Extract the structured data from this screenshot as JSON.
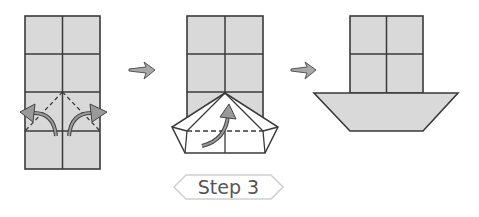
{
  "diagram": {
    "type": "origami-instructions",
    "step_label": "Step 3",
    "colors": {
      "paper_fill": "#d9d9d9",
      "outline": "#3a3a3a",
      "arrow_fill": "#9a9a9a",
      "arrow_stroke": "#444444",
      "badge_stroke": "#cfcfcf",
      "text": "#555555"
    },
    "figures": [
      {
        "id": "fig-1",
        "description": "2x4 grid paper with two dashed diagonal fold lines and curved arrows folding corners outward"
      },
      {
        "id": "fig-2",
        "description": "grid with bottom folded into pentagon shape, dashed horizontal fold line, curved arrow folding up"
      },
      {
        "id": "fig-3",
        "description": "completed boat: 2x2 grid cabin on top of trapezoid hull"
      }
    ],
    "progression_arrows": 2
  }
}
